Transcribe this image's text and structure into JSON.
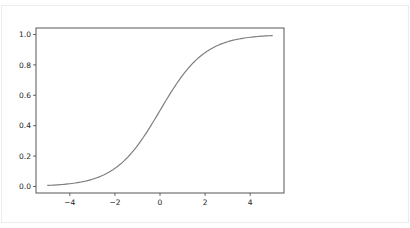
{
  "chart_data": {
    "type": "line",
    "title": "",
    "xlabel": "",
    "ylabel": "",
    "xlim": [
      -5.5,
      5.5
    ],
    "ylim": [
      -0.043,
      1.043
    ],
    "grid": false,
    "legend": null,
    "x_ticks": [
      -4,
      -2,
      0,
      2,
      4
    ],
    "x_tick_labels": [
      "−4",
      "−2",
      "0",
      "2",
      "4"
    ],
    "y_ticks": [
      0.0,
      0.2,
      0.4,
      0.6,
      0.8,
      1.0
    ],
    "y_tick_labels": [
      "0.0",
      "0.2",
      "0.4",
      "0.6",
      "0.8",
      "1.0"
    ],
    "series": [
      {
        "name": "sigmoid",
        "color": "#7f7f7f",
        "function": "1/(1+exp(-x))",
        "x": [
          -5,
          -4,
          -3,
          -2,
          -1,
          0,
          1,
          2,
          3,
          4,
          5
        ],
        "y": [
          0.0067,
          0.018,
          0.047,
          0.119,
          0.269,
          0.5,
          0.731,
          0.881,
          0.953,
          0.982,
          0.9933
        ]
      }
    ]
  },
  "colors": {
    "axes": "#444444",
    "line": "#7f7f7f",
    "card_border": "#ececec"
  }
}
